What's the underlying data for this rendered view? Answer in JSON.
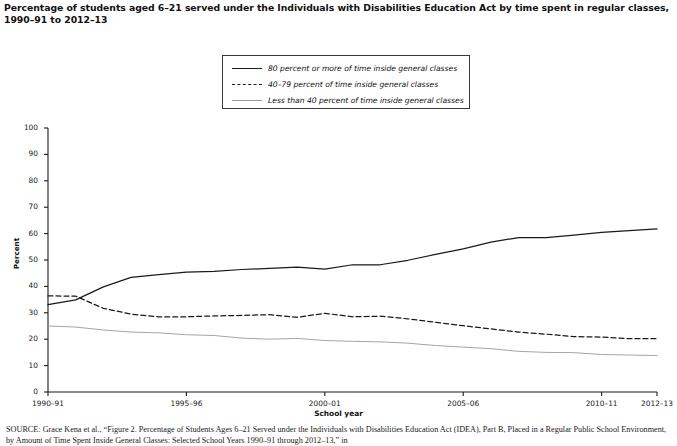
{
  "title": "Percentage of students aged 6–21 served under the Individuals with Disabilities Education Act by time spent in regular classes, 1990–91 to 2012–13",
  "legend": {
    "items": [
      {
        "label": "80 percent or more of time inside general classes",
        "style": "solid",
        "color": "#1a1a1a"
      },
      {
        "label": "40–79 percent of time inside general classes",
        "style": "dashed",
        "color": "#1a1a1a"
      },
      {
        "label": "Less than 40 percent of time inside general classes",
        "style": "light-solid",
        "color": "#9a9a9a"
      }
    ]
  },
  "source": {
    "prefix": "SOURCE:",
    "text": " Grace Kena et al., “Figure 2. Percentage of Students Ages 6–21 Served under the Individuals with Disabilities Education Act (IDEA), Part B,",
    "line2": "Placed in a Regular Public School Environment, by Amount of Time Spent Inside General Classes: Selected School Years 1990–91 through 2012–13,” in"
  },
  "chart_data": {
    "type": "line",
    "title": "Percentage of students aged 6–21 served under the Individuals with Disabilities Education Act by time spent in regular classes, 1990–91 to 2012–13",
    "xlabel": "School year",
    "ylabel": "Percent",
    "ylim": [
      0,
      100
    ],
    "ytick_values": [
      0,
      10,
      20,
      30,
      40,
      50,
      60,
      70,
      80,
      90,
      100
    ],
    "grid": false,
    "legend_position": "top-center",
    "x": [
      "1990–91",
      "1991–92",
      "1992–93",
      "1993–94",
      "1994–95",
      "1995–96",
      "1996–97",
      "1997–98",
      "1998–99",
      "1999–2000",
      "2000–01",
      "2001–02",
      "2002–03",
      "2003–04",
      "2004–05",
      "2005–06",
      "2006–07",
      "2007–08",
      "2008–09",
      "2009–10",
      "2010–11",
      "2011–12",
      "2012–13"
    ],
    "xtick_labels": [
      "1990–91",
      "1995–96",
      "2000–01",
      "2005–06",
      "2010–11",
      "2012–13"
    ],
    "xtick_indices": [
      0,
      5,
      10,
      15,
      20,
      22
    ],
    "series": [
      {
        "name": "80 percent or more of time inside general classes",
        "style": "solid",
        "color": "#1a1a1a",
        "values": [
          33.1,
          34.9,
          39.8,
          43.4,
          44.5,
          45.4,
          45.7,
          46.4,
          46.8,
          47.3,
          46.5,
          48.2,
          48.2,
          49.9,
          52.1,
          54.2,
          56.8,
          58.5,
          58.5,
          59.4,
          60.5,
          61.1,
          61.8
        ]
      },
      {
        "name": "40–79 percent of time inside general classes",
        "style": "dashed",
        "color": "#1a1a1a",
        "values": [
          36.4,
          36.3,
          31.7,
          29.5,
          28.5,
          28.5,
          28.8,
          29.0,
          29.3,
          28.3,
          29.8,
          28.5,
          28.7,
          27.7,
          26.4,
          25.1,
          23.9,
          22.7,
          21.9,
          21.0,
          20.8,
          20.2,
          20.2
        ]
      },
      {
        "name": "Less than 40 percent of time inside general classes",
        "style": "light-solid",
        "color": "#9a9a9a",
        "values": [
          25.0,
          24.6,
          23.5,
          22.7,
          22.4,
          21.7,
          21.4,
          20.4,
          20.0,
          20.3,
          19.5,
          19.2,
          19.0,
          18.5,
          17.6,
          17.0,
          16.4,
          15.4,
          15.0,
          14.9,
          14.2,
          14.0,
          13.8
        ]
      }
    ]
  }
}
